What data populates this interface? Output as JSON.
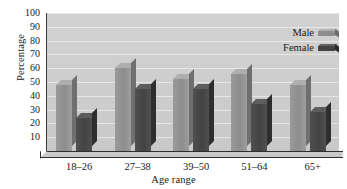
{
  "chart_data": {
    "type": "bar",
    "title": "",
    "xlabel": "Age range",
    "ylabel": "Percentage",
    "categories": [
      "18–26",
      "27–38",
      "39–50",
      "51–64",
      "65+"
    ],
    "series": [
      {
        "name": "Male",
        "values": [
          48,
          60,
          52,
          56,
          48
        ],
        "color": "#8d8d8d"
      },
      {
        "name": "Female",
        "values": [
          24,
          45,
          45,
          34,
          28
        ],
        "color": "#434343"
      }
    ],
    "ylim": [
      0,
      100
    ],
    "ytick_values": [
      0,
      10,
      20,
      30,
      40,
      50,
      60,
      70,
      80,
      90,
      100
    ],
    "ytick_labels": [
      "",
      "10",
      "20",
      "30",
      "40",
      "50",
      "60",
      "70",
      "80",
      "90",
      "100"
    ],
    "grid": true,
    "grid_axis": "y",
    "legend_position": "top-right",
    "style": "3d-bars",
    "plot_background": "#cfcfcf",
    "gridline_color": "#e9e9e9",
    "axis_color": "#2f2f2f"
  }
}
